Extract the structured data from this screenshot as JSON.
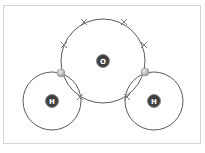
{
  "diagram": {
    "type": "dot-and-cross covalent bonding",
    "molecule": "water",
    "colors": {
      "shell": "#5a5a5a",
      "nucleus": "#3f3f3f",
      "nucleus_ring": "#8a8a8a",
      "nucleus_text": "#ffffff",
      "shared_electron": "#b8b8b8",
      "cross": "#7a7a7a",
      "frame": "#d4d4d4"
    },
    "atoms": [
      {
        "symbol": "O",
        "label": "O",
        "cx": 103,
        "cy": 61,
        "shell_r": 42
      },
      {
        "symbol": "H",
        "label": "H",
        "cx": 52,
        "cy": 101,
        "shell_r": 29
      },
      {
        "symbol": "H",
        "label": "H",
        "cx": 154,
        "cy": 101,
        "shell_r": 29
      }
    ],
    "electrons": {
      "shared_dots": [
        {
          "x": 61,
          "y": 73
        },
        {
          "x": 145,
          "y": 72
        }
      ],
      "crosses": [
        {
          "x": 64,
          "y": 45
        },
        {
          "x": 84,
          "y": 22
        },
        {
          "x": 124,
          "y": 22
        },
        {
          "x": 144,
          "y": 45
        },
        {
          "x": 80,
          "y": 97
        },
        {
          "x": 127,
          "y": 97
        }
      ]
    }
  }
}
